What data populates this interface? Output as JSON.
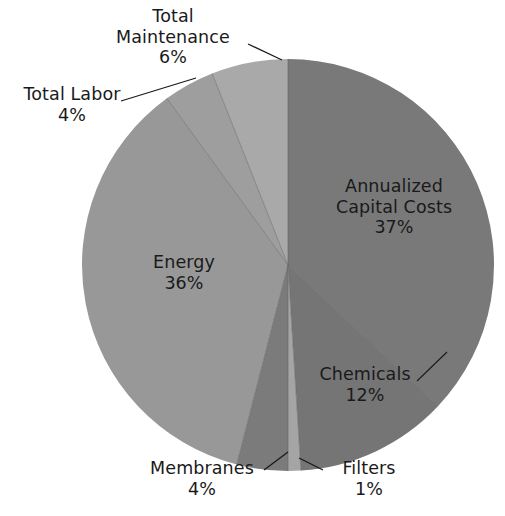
{
  "chart_data": {
    "type": "pie",
    "title": "",
    "subtitle": "",
    "xlabel": "",
    "ylabel": "",
    "legend_position": "none",
    "grid": false,
    "labels_inside_or_callout": "mixed",
    "total_percent": 100,
    "categories": [
      "Annualized Capital Costs",
      "Chemicals",
      "Filters",
      "Membranes",
      "Energy",
      "Total Labor",
      "Total Maintenance"
    ],
    "values": [
      37,
      12,
      1,
      4,
      36,
      4,
      6
    ],
    "value_unit": "%",
    "slices": [
      {
        "name": "Annualized Capital Costs",
        "value": 37,
        "value_text": "37%",
        "label_line1": "Annualized",
        "label_line2": "Capital Costs",
        "color": "#797979",
        "label_style": "inside",
        "callout": false
      },
      {
        "name": "Chemicals",
        "value": 12,
        "value_text": "12%",
        "label_line1": "Chemicals",
        "label_line2": "",
        "color": "#757575",
        "label_style": "inside",
        "callout": true
      },
      {
        "name": "Filters",
        "value": 1,
        "value_text": "1%",
        "label_line1": "Filters",
        "label_line2": "",
        "color": "#a5a5a5",
        "label_style": "outside",
        "callout": true
      },
      {
        "name": "Membranes",
        "value": 4,
        "value_text": "4%",
        "label_line1": "Membranes",
        "label_line2": "",
        "color": "#7b7b7b",
        "label_style": "outside",
        "callout": true
      },
      {
        "name": "Energy",
        "value": 36,
        "value_text": "36%",
        "label_line1": "Energy",
        "label_line2": "",
        "color": "#989898",
        "label_style": "inside",
        "callout": false
      },
      {
        "name": "Total Labor",
        "value": 4,
        "value_text": "4%",
        "label_line1": "Total Labor",
        "label_line2": "",
        "color": "#9e9e9e",
        "label_style": "outside",
        "callout": true
      },
      {
        "name": "Total Maintenance",
        "value": 6,
        "value_text": "6%",
        "label_line1": "Total",
        "label_line2": "Maintenance",
        "color": "#a9a9a9",
        "label_style": "outside",
        "callout": true
      }
    ],
    "colors": {
      "background": "#ffffff",
      "text": "#1a1a1a",
      "slice_divider": "#5f5f5f",
      "callout_line": "#1a1a1a"
    },
    "geometry": {
      "center_x": 288,
      "center_y": 265,
      "radius": 206,
      "start_angle_deg": 0,
      "direction": "clockwise"
    }
  },
  "labels": {
    "maintenance": {
      "line1": "Total",
      "line2": "Maintenance",
      "value": "6%"
    },
    "labor": {
      "line1": "Total Labor",
      "value": "4%"
    },
    "energy": {
      "line1": "Energy",
      "value": "36%"
    },
    "capital": {
      "line1": "Annualized",
      "line2": "Capital Costs",
      "value": "37%"
    },
    "chemicals": {
      "line1": "Chemicals",
      "value": "12%"
    },
    "membranes": {
      "line1": "Membranes",
      "value": "4%"
    },
    "filters": {
      "line1": "Filters",
      "value": "1%"
    }
  }
}
